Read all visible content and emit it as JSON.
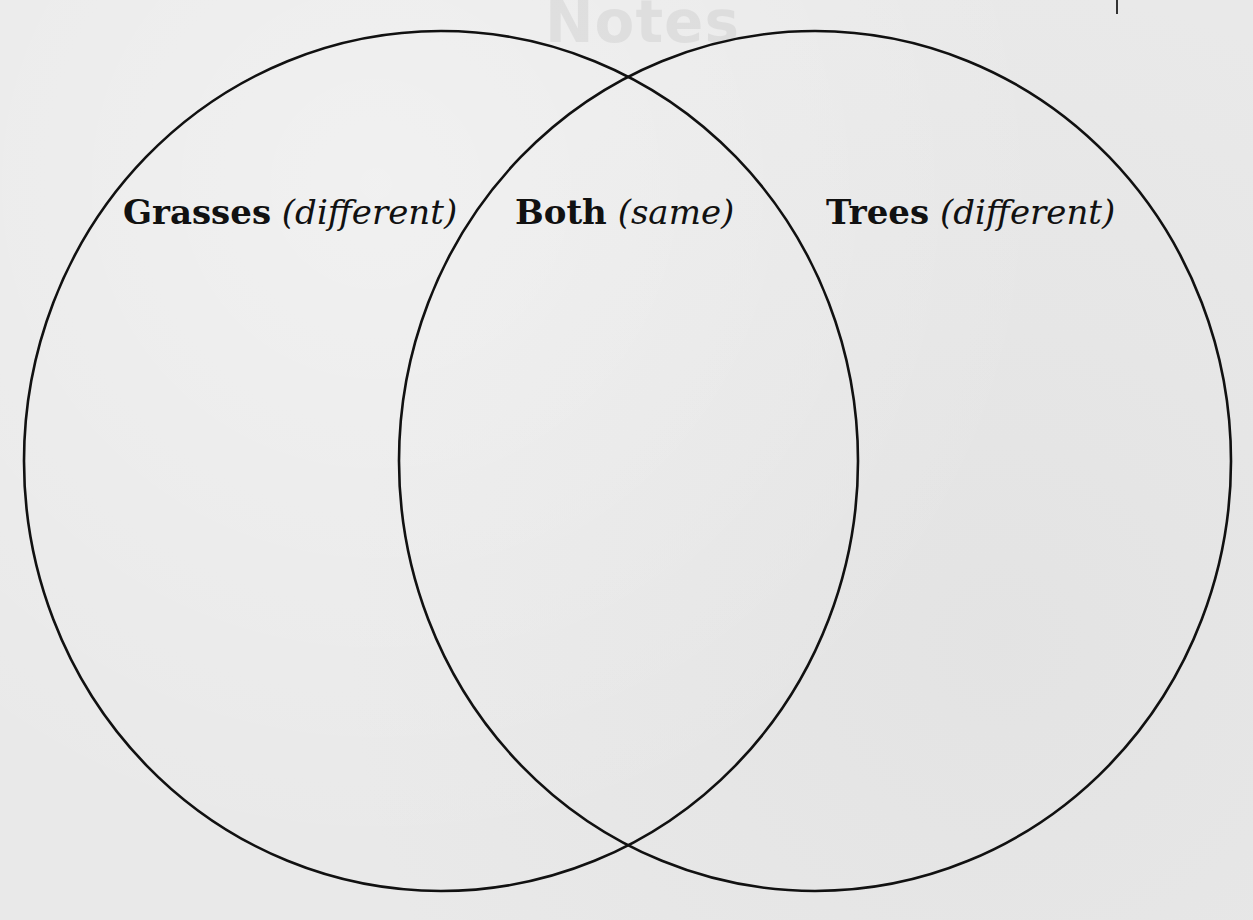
{
  "diagram": {
    "type": "venn",
    "background_color": "#e9e9e9",
    "line_color": "#111111",
    "watermark_text": "Notes",
    "sets": [
      {
        "id": "left",
        "title": "Grasses",
        "qualifier": "(different)",
        "cx": 441,
        "cy": 461,
        "rx": 417,
        "ry": 430
      },
      {
        "id": "right",
        "title": "Trees",
        "qualifier": "(different)",
        "cx": 815,
        "cy": 461,
        "rx": 416,
        "ry": 430
      }
    ],
    "overlap": {
      "title": "Both",
      "qualifier": "(same)"
    }
  }
}
